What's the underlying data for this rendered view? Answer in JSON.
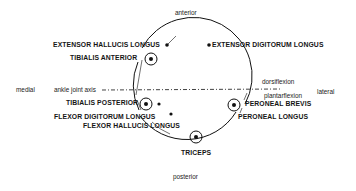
{
  "orientation": {
    "anterior": "anterior",
    "posterior": "posterior",
    "medial": "medial",
    "lateral": "lateral"
  },
  "axis": {
    "label": "ankle joint axis",
    "above": "dorsiflexion",
    "below": "plantarflexion"
  },
  "muscles": {
    "extensor_hallucis_longus": "EXTENSOR HALLUCIS LONGUS",
    "extensor_digitorum_longus": "EXTENSOR DIGITORUM LONGUS",
    "tibialis_anterior": "TIBIALIS ANTERIOR",
    "tibialis_posterior": "TIBIALIS POSTERIOR",
    "flexor_digitorum_longus": "FLEXOR DIGITORUM LONGUS",
    "flexor_hallucis_longus": "FLEXOR HALLUCIS LONGUS",
    "peroneal_brevis": "PERONEAL BREVIS",
    "peroneal_longus": "PERONEAL LONGUS",
    "triceps": "TRICEPS"
  },
  "colors": {
    "ink": "#111111",
    "background": "#ffffff"
  }
}
